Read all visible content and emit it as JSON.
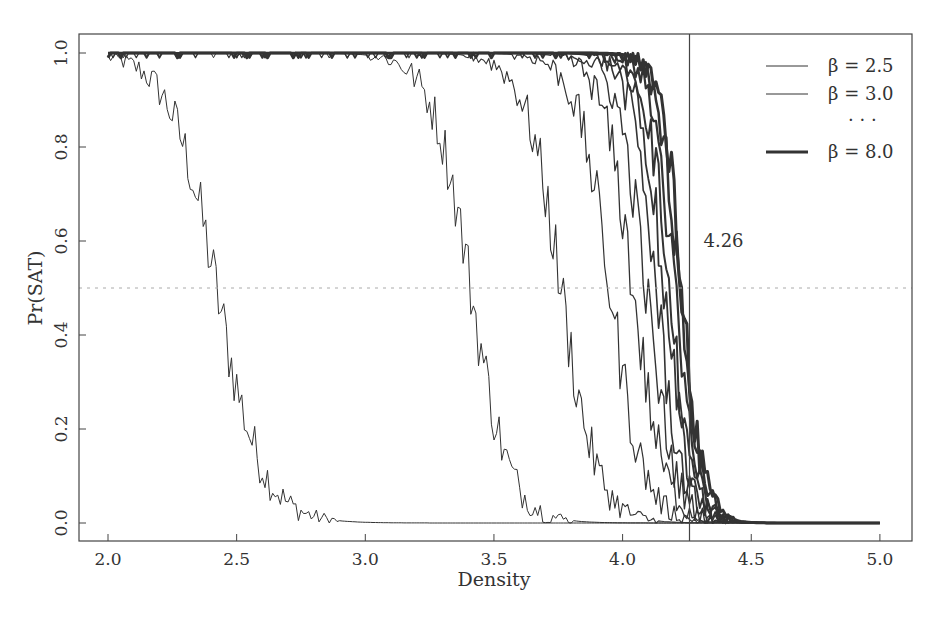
{
  "chart_data": {
    "type": "line",
    "title": "",
    "xlabel": "Density",
    "ylabel": "Pr(SAT)",
    "xlim": [
      1.88,
      5.12
    ],
    "ylim": [
      -0.04,
      1.04
    ],
    "xticks": [
      2.0,
      2.5,
      3.0,
      3.5,
      4.0,
      4.5,
      5.0
    ],
    "xtick_labels": [
      "2.0",
      "2.5",
      "3.0",
      "3.5",
      "4.0",
      "4.5",
      "5.0"
    ],
    "yticks": [
      0.0,
      0.2,
      0.4,
      0.6,
      0.8,
      1.0
    ],
    "ytick_labels": [
      "0.0",
      "0.2",
      "0.4",
      "0.6",
      "0.8",
      "1.0"
    ],
    "grid": false,
    "reference_lines": {
      "horizontal": {
        "y": 0.5,
        "style": "dotted"
      },
      "vertical": {
        "x": 4.26,
        "style": "solid",
        "label": "4.26"
      }
    },
    "legend": {
      "position": "upper right",
      "entries": [
        "β = 2.5",
        "β = 3.0",
        "· · ·",
        "β = 8.0"
      ]
    },
    "x_range": [
      2.0,
      5.0
    ],
    "series": [
      {
        "name": "β = 2.5",
        "midpoint": 2.42,
        "width": 0.09,
        "stroke": 1.0
      },
      {
        "name": "β = 3.0",
        "midpoint": 3.41,
        "width": 0.075,
        "stroke": 1.0
      },
      {
        "name": "β = 3.5",
        "midpoint": 3.76,
        "width": 0.07,
        "stroke": 1.1
      },
      {
        "name": "β = 4.0",
        "midpoint": 3.95,
        "width": 0.065,
        "stroke": 1.2
      },
      {
        "name": "β = 4.5",
        "midpoint": 4.04,
        "width": 0.06,
        "stroke": 1.3
      },
      {
        "name": "β = 5.0",
        "midpoint": 4.09,
        "width": 0.055,
        "stroke": 1.4
      },
      {
        "name": "β = 5.5",
        "midpoint": 4.13,
        "width": 0.05,
        "stroke": 1.6
      },
      {
        "name": "β = 6.0",
        "midpoint": 4.16,
        "width": 0.048,
        "stroke": 1.8
      },
      {
        "name": "β = 6.5",
        "midpoint": 4.18,
        "width": 0.045,
        "stroke": 2.0
      },
      {
        "name": "β = 7.0",
        "midpoint": 4.2,
        "width": 0.043,
        "stroke": 2.2
      },
      {
        "name": "β = 7.5",
        "midpoint": 4.22,
        "width": 0.042,
        "stroke": 2.5
      },
      {
        "name": "β = 8.0",
        "midpoint": 4.23,
        "width": 0.04,
        "stroke": 3.0
      }
    ],
    "annotations": [
      {
        "text": "4.26",
        "x": 4.26,
        "y": 0.6
      }
    ]
  },
  "colors": {
    "line": "#333333",
    "axis": "#444444",
    "refline_h": "#aaaaaa",
    "background": "#ffffff"
  }
}
